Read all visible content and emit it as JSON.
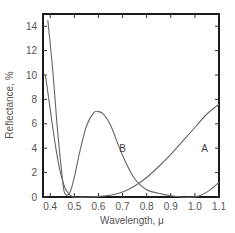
{
  "chart_data": {
    "type": "line",
    "title": "",
    "xlabel": "Wavelength, μ",
    "ylabel": "Reflectance, %",
    "xlim": [
      0.37,
      1.1
    ],
    "ylim": [
      0,
      15
    ],
    "xticks": [
      0.4,
      0.5,
      0.6,
      0.7,
      0.8,
      0.9,
      1.0,
      1.1
    ],
    "xtick_labels": [
      "0.4",
      "0.5",
      "0.6",
      "0.7",
      "0.8",
      "0.9",
      "1.0",
      "1.1"
    ],
    "yticks": [
      0,
      2,
      4,
      6,
      8,
      10,
      12,
      14
    ],
    "ytick_labels": [
      "0",
      "2",
      "4",
      "6",
      "8",
      "10",
      "12",
      "14"
    ],
    "grid": false,
    "legend": "none (curves labeled inline)",
    "series": [
      {
        "name": "A",
        "label_position": {
          "x": 1.04,
          "y": 3.7
        },
        "x": [
          0.38,
          0.4,
          0.42,
          0.44,
          0.46,
          0.48,
          0.5,
          0.55,
          0.6,
          0.65,
          0.7,
          0.75,
          0.8,
          0.85,
          0.9,
          0.95,
          1.0,
          1.05,
          1.1
        ],
        "y": [
          10.0,
          7.2,
          4.4,
          2.2,
          0.8,
          0.2,
          0.0,
          0.0,
          0.05,
          0.15,
          0.4,
          0.9,
          1.6,
          2.5,
          3.5,
          4.6,
          5.7,
          6.8,
          7.6
        ]
      },
      {
        "name": "B",
        "label_position": {
          "x": 0.7,
          "y": 3.7
        },
        "x": [
          0.39,
          0.41,
          0.43,
          0.45,
          0.46,
          0.48,
          0.5,
          0.52,
          0.55,
          0.58,
          0.6,
          0.62,
          0.65,
          0.7,
          0.75,
          0.8,
          0.85,
          0.9,
          0.95,
          1.0,
          1.05,
          1.1
        ],
        "y": [
          14.5,
          10.5,
          5.5,
          1.6,
          0.3,
          0.3,
          1.6,
          3.5,
          5.8,
          6.9,
          7.0,
          6.8,
          5.9,
          3.4,
          1.5,
          0.6,
          0.3,
          0.1,
          0.0,
          0.0,
          0.4,
          1.2
        ]
      }
    ]
  }
}
